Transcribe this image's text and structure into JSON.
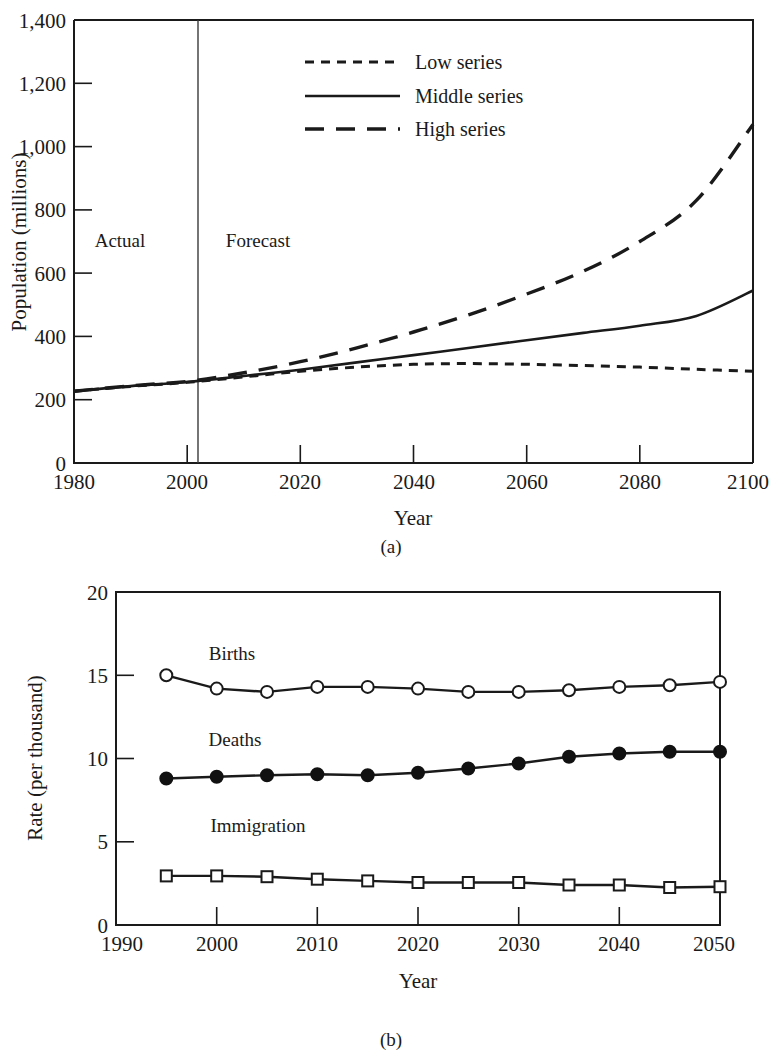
{
  "figure_a": {
    "caption": "(a)",
    "annotations": {
      "actual": "Actual",
      "forecast": "Forecast"
    },
    "legend": [
      {
        "label": "Low series",
        "style": "short-dashed"
      },
      {
        "label": "Middle series",
        "style": "solid"
      },
      {
        "label": "High series",
        "style": "long-dashed"
      }
    ]
  },
  "figure_b": {
    "caption": "(b)",
    "series_labels": {
      "births": "Births",
      "deaths": "Deaths",
      "immigration": "Immigration"
    }
  },
  "chart_data": [
    {
      "type": "line",
      "id": "a",
      "title": "",
      "xlabel": "Year",
      "ylabel": "Population (millions)",
      "xlim": [
        1980,
        2100
      ],
      "ylim": [
        0,
        1400
      ],
      "xticks": [
        1980,
        2000,
        2020,
        2040,
        2060,
        2080,
        2100
      ],
      "xtick_labels": [
        "1980",
        "2000",
        "2020",
        "2040",
        "2060",
        "2080",
        "2100"
      ],
      "yticks": [
        0,
        200,
        400,
        600,
        800,
        1000,
        1200,
        1400
      ],
      "ytick_labels": [
        "0",
        "200",
        "400",
        "600",
        "800",
        "1,000",
        "1,200",
        "1,400"
      ],
      "grid": false,
      "legend_position": "top-center",
      "divider_year": 2000,
      "x": [
        1980,
        1990,
        2000,
        2010,
        2020,
        2030,
        2040,
        2050,
        2060,
        2070,
        2080,
        2090,
        2100
      ],
      "series": [
        {
          "name": "Low series",
          "style": "short-dashed",
          "values": [
            227,
            242,
            255,
            272,
            290,
            303,
            312,
            314,
            312,
            308,
            303,
            296,
            290
          ]
        },
        {
          "name": "Middle series",
          "style": "solid",
          "values": [
            227,
            243,
            256,
            275,
            295,
            318,
            341,
            364,
            388,
            411,
            434,
            465,
            545
          ]
        },
        {
          "name": "High series",
          "style": "long-dashed",
          "values": [
            227,
            244,
            258,
            285,
            320,
            364,
            414,
            470,
            534,
            606,
            700,
            830,
            1070
          ]
        }
      ]
    },
    {
      "type": "line",
      "id": "b",
      "title": "",
      "xlabel": "Year",
      "ylabel": "Rate (per thousand)",
      "xlim": [
        1990,
        2050
      ],
      "ylim": [
        0,
        20
      ],
      "xticks": [
        1990,
        2000,
        2010,
        2020,
        2030,
        2040,
        2050
      ],
      "xtick_labels": [
        "1990",
        "2000",
        "2010",
        "2020",
        "2030",
        "2040",
        "2050"
      ],
      "yticks": [
        0,
        5,
        10,
        15,
        20
      ],
      "ytick_labels": [
        "0",
        "5",
        "10",
        "15",
        "20"
      ],
      "grid": false,
      "legend_position": "inline-labels",
      "x": [
        1995,
        2000,
        2005,
        2010,
        2015,
        2020,
        2025,
        2030,
        2035,
        2040,
        2045,
        2050
      ],
      "series": [
        {
          "name": "Births",
          "marker": "open-circle",
          "values": [
            15.0,
            14.2,
            14.0,
            14.3,
            14.3,
            14.2,
            14.0,
            14.0,
            14.1,
            14.3,
            14.4,
            14.6
          ]
        },
        {
          "name": "Deaths",
          "marker": "filled-circle",
          "values": [
            8.8,
            8.9,
            9.0,
            9.05,
            9.0,
            9.15,
            9.4,
            9.7,
            10.1,
            10.3,
            10.4,
            10.4
          ]
        },
        {
          "name": "Immigration",
          "marker": "open-square",
          "values": [
            2.95,
            2.95,
            2.9,
            2.75,
            2.65,
            2.55,
            2.55,
            2.55,
            2.4,
            2.4,
            2.25,
            2.3
          ]
        }
      ]
    }
  ]
}
